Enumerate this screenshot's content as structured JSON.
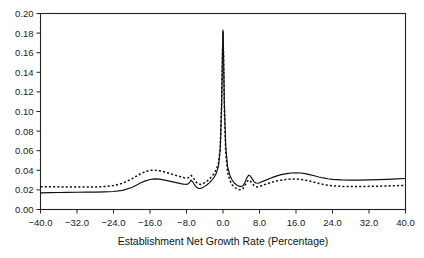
{
  "chart_data": {
    "type": "line",
    "title": "",
    "xlabel": "Establishment Net Growth Rate (Percentage)",
    "ylabel": "",
    "xlim": [
      -40.0,
      40.0
    ],
    "ylim": [
      0.0,
      0.2
    ],
    "grid": false,
    "legend": "none",
    "xticks": [
      -40.0,
      -32.0,
      -24.0,
      -16.0,
      -8.0,
      0.0,
      8.0,
      16.0,
      24.0,
      32.0,
      40.0
    ],
    "xtick_labels": [
      "-40.0",
      "-32.0",
      "-24.0",
      "-16.0",
      "-8.0",
      "0.0",
      "8.0",
      "16.0",
      "24.0",
      "32.0",
      "40.0"
    ],
    "yticks": [
      0.0,
      0.02,
      0.04,
      0.06,
      0.08,
      0.1,
      0.12,
      0.14,
      0.16,
      0.18,
      0.2
    ],
    "ytick_labels": [
      "0.00",
      "0.02",
      "0.04",
      "0.06",
      "0.08",
      "0.10",
      "0.12",
      "0.14",
      "0.16",
      "0.18",
      "0.20"
    ],
    "series": [
      {
        "name": "solid-density",
        "style": "solid",
        "color": "#111111",
        "x": [
          -40.0,
          -38.0,
          -36.0,
          -34.0,
          -32.0,
          -30.0,
          -28.0,
          -26.0,
          -24.0,
          -22.0,
          -20.0,
          -19.0,
          -18.0,
          -17.0,
          -16.0,
          -15.0,
          -14.0,
          -13.0,
          -12.0,
          -11.0,
          -10.0,
          -9.5,
          -9.0,
          -8.5,
          -8.0,
          -7.6,
          -7.2,
          -7.0,
          -6.6,
          -6.2,
          -5.8,
          -5.4,
          -5.0,
          -4.5,
          -4.0,
          -3.5,
          -3.0,
          -2.5,
          -2.0,
          -1.5,
          -1.0,
          -0.6,
          -0.3,
          -0.1,
          0.0,
          0.1,
          0.3,
          0.6,
          1.0,
          1.5,
          2.0,
          2.5,
          3.0,
          3.5,
          4.0,
          4.4,
          4.8,
          5.2,
          5.6,
          6.0,
          6.4,
          6.8,
          7.2,
          7.6,
          8.0,
          9.0,
          10.0,
          11.0,
          12.0,
          13.0,
          14.0,
          15.0,
          16.0,
          17.0,
          18.0,
          19.0,
          20.0,
          21.0,
          22.0,
          23.0,
          24.0,
          26.0,
          28.0,
          30.0,
          32.0,
          34.0,
          36.0,
          38.0,
          40.0
        ],
        "y": [
          0.017,
          0.0172,
          0.0174,
          0.0175,
          0.0176,
          0.0177,
          0.0178,
          0.018,
          0.0184,
          0.0195,
          0.0225,
          0.0248,
          0.0272,
          0.0292,
          0.0306,
          0.0312,
          0.031,
          0.0302,
          0.0292,
          0.0282,
          0.0272,
          0.0267,
          0.0262,
          0.0258,
          0.0256,
          0.0262,
          0.0285,
          0.03,
          0.028,
          0.0248,
          0.0226,
          0.0216,
          0.0214,
          0.0222,
          0.0236,
          0.0252,
          0.0272,
          0.0296,
          0.0326,
          0.0366,
          0.044,
          0.062,
          0.108,
          0.164,
          0.183,
          0.164,
          0.108,
          0.064,
          0.044,
          0.035,
          0.03,
          0.027,
          0.025,
          0.0238,
          0.0233,
          0.0244,
          0.0276,
          0.032,
          0.035,
          0.0342,
          0.0312,
          0.0284,
          0.027,
          0.0268,
          0.0272,
          0.0292,
          0.0312,
          0.033,
          0.0346,
          0.0358,
          0.0366,
          0.0372,
          0.0374,
          0.0372,
          0.0366,
          0.0356,
          0.0344,
          0.0332,
          0.0322,
          0.0314,
          0.0308,
          0.0302,
          0.03,
          0.03,
          0.0302,
          0.0305,
          0.0308,
          0.0312,
          0.0316
        ]
      },
      {
        "name": "dotted-density",
        "style": "dotted",
        "color": "#111111",
        "x": [
          -40.0,
          -38.0,
          -36.0,
          -34.0,
          -32.0,
          -30.0,
          -28.0,
          -26.0,
          -24.0,
          -22.0,
          -20.0,
          -19.0,
          -18.0,
          -17.0,
          -16.0,
          -15.0,
          -14.0,
          -13.0,
          -12.0,
          -11.0,
          -10.0,
          -9.5,
          -9.0,
          -8.5,
          -8.0,
          -7.6,
          -7.2,
          -7.0,
          -6.6,
          -6.2,
          -5.8,
          -5.4,
          -5.0,
          -4.5,
          -4.0,
          -3.5,
          -3.0,
          -2.5,
          -2.0,
          -1.5,
          -1.0,
          -0.6,
          -0.3,
          -0.1,
          0.0,
          0.1,
          0.3,
          0.6,
          1.0,
          1.5,
          2.0,
          2.5,
          3.0,
          3.5,
          4.0,
          4.4,
          4.8,
          5.2,
          5.6,
          6.0,
          6.4,
          6.8,
          7.2,
          7.6,
          8.0,
          9.0,
          10.0,
          11.0,
          12.0,
          13.0,
          14.0,
          15.0,
          16.0,
          17.0,
          18.0,
          19.0,
          20.0,
          21.0,
          22.0,
          23.0,
          24.0,
          26.0,
          28.0,
          30.0,
          32.0,
          34.0,
          36.0,
          38.0,
          40.0
        ],
        "y": [
          0.0232,
          0.0232,
          0.0231,
          0.023,
          0.0229,
          0.0229,
          0.023,
          0.0234,
          0.0244,
          0.0268,
          0.0312,
          0.034,
          0.0366,
          0.0388,
          0.04,
          0.0402,
          0.0396,
          0.0386,
          0.0372,
          0.0358,
          0.0344,
          0.0337,
          0.033,
          0.0324,
          0.032,
          0.0324,
          0.034,
          0.0348,
          0.033,
          0.03,
          0.0276,
          0.0262,
          0.0256,
          0.0262,
          0.0274,
          0.029,
          0.031,
          0.0334,
          0.0364,
          0.0404,
          0.047,
          0.063,
          0.106,
          0.162,
          0.181,
          0.16,
          0.102,
          0.058,
          0.038,
          0.0296,
          0.0252,
          0.0228,
          0.0212,
          0.0204,
          0.0202,
          0.0214,
          0.0244,
          0.0282,
          0.03,
          0.029,
          0.0266,
          0.0244,
          0.0232,
          0.023,
          0.0234,
          0.0252,
          0.0268,
          0.0282,
          0.0294,
          0.0302,
          0.0308,
          0.0312,
          0.0312,
          0.0308,
          0.03,
          0.029,
          0.0278,
          0.0266,
          0.0256,
          0.0248,
          0.0242,
          0.0236,
          0.0234,
          0.0234,
          0.0236,
          0.0238,
          0.024,
          0.0243,
          0.0246
        ]
      }
    ]
  },
  "axis": {
    "xlabel_text": "Establishment Net Growth Rate (Percentage)"
  }
}
